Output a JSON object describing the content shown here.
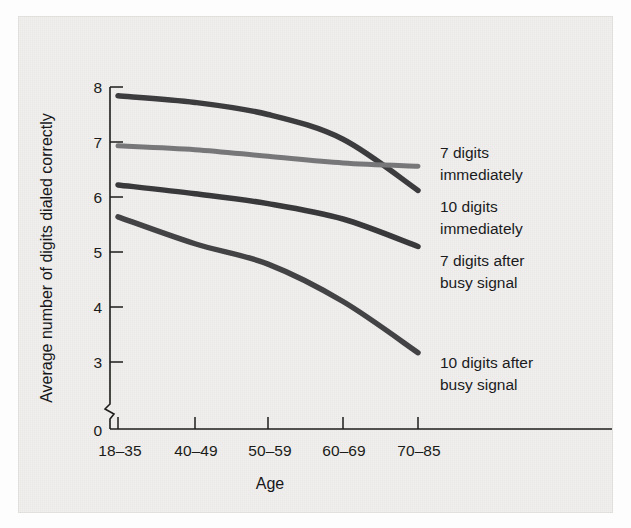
{
  "figure": {
    "background_color": "#f0efed",
    "ink_color": "#1d1d1b"
  },
  "chart_data": {
    "type": "line",
    "title": "",
    "xlabel": "Age",
    "ylabel": "Average number of digits dialed correctly",
    "categories": [
      "18–35",
      "40–49",
      "50–59",
      "60–69",
      "70–85"
    ],
    "yticks": [
      "0",
      "3",
      "4",
      "5",
      "6",
      "7",
      "8"
    ],
    "ytick_values": [
      0,
      3,
      4,
      5,
      6,
      7,
      8
    ],
    "ylim": [
      3,
      8
    ],
    "axis_break": true,
    "axis_break_note": "y-axis broken between 0 and 3",
    "grid": false,
    "legend_position": "right-of-lines",
    "series": [
      {
        "name": "7 digits immediately",
        "label_line1": "7 digits",
        "label_line2": "immediately",
        "color": "#3c3c3e",
        "stroke_width": 5.5,
        "values": [
          7.84,
          7.72,
          7.5,
          7.05,
          6.12
        ]
      },
      {
        "name": "10 digits immediately",
        "label_line1": "10 digits",
        "label_line2": "immediately",
        "color": "#77777a",
        "stroke_width": 5.0,
        "values": [
          6.93,
          6.86,
          6.74,
          6.62,
          6.56
        ]
      },
      {
        "name": "7 digits after busy signal",
        "label_line1": "7 digits after",
        "label_line2": "busy signal",
        "color": "#39393b",
        "stroke_width": 5.5,
        "values": [
          6.22,
          6.06,
          5.88,
          5.6,
          5.1
        ]
      },
      {
        "name": "10 digits after busy signal",
        "label_line1": "10 digits after",
        "label_line2": "busy signal",
        "color": "#434345",
        "stroke_width": 5.5,
        "values": [
          5.64,
          5.15,
          4.78,
          4.1,
          3.17
        ]
      }
    ]
  },
  "legend": {
    "entries": [
      {
        "line1": "7 digits",
        "line2": "immediately"
      },
      {
        "line1": "10 digits",
        "line2": "immediately"
      },
      {
        "line1": "7 digits after",
        "line2": "busy signal"
      },
      {
        "line1": "10 digits after",
        "line2": "busy signal"
      }
    ]
  }
}
